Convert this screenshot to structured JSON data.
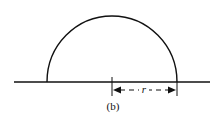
{
  "diagram": {
    "type": "semicircle-radius",
    "radius_label": "r",
    "caption": "(b)",
    "stroke_color": "#111111",
    "background": "#ffffff"
  }
}
